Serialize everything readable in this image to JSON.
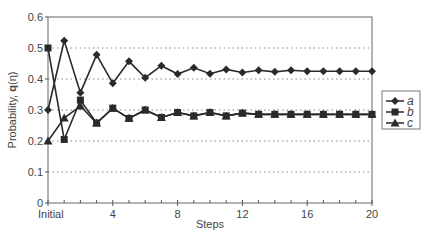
{
  "chart_data": {
    "type": "line",
    "title": "",
    "xlabel": "Steps",
    "ylabel": "Probability, q(η)",
    "ylabel_bold_part": "q",
    "ylabel_prefix": "Probability, ",
    "ylabel_suffix": "(η)",
    "x": [
      0,
      1,
      2,
      3,
      4,
      5,
      6,
      7,
      8,
      9,
      10,
      11,
      12,
      13,
      14,
      15,
      16,
      17,
      18,
      19,
      20
    ],
    "xlim": [
      0,
      20
    ],
    "ylim": [
      0,
      0.6
    ],
    "xticks": [
      {
        "value": 0,
        "label": "Initial"
      },
      {
        "value": 4,
        "label": "4"
      },
      {
        "value": 8,
        "label": "8"
      },
      {
        "value": 12,
        "label": "12"
      },
      {
        "value": 16,
        "label": "16"
      },
      {
        "value": 20,
        "label": "20"
      }
    ],
    "yticks": [
      {
        "value": 0,
        "label": "0"
      },
      {
        "value": 0.1,
        "label": "0.1"
      },
      {
        "value": 0.2,
        "label": "0.2"
      },
      {
        "value": 0.3,
        "label": "0.3"
      },
      {
        "value": 0.4,
        "label": "0.4"
      },
      {
        "value": 0.5,
        "label": "0.5"
      },
      {
        "value": 0.6,
        "label": "0.6"
      }
    ],
    "grid": {
      "y": true,
      "x": false,
      "style": "dotted"
    },
    "legend_position": "right",
    "series": [
      {
        "name": "a",
        "marker": "diamond",
        "values": [
          0.3,
          0.523,
          0.356,
          0.478,
          0.386,
          0.457,
          0.404,
          0.443,
          0.416,
          0.436,
          0.417,
          0.431,
          0.421,
          0.428,
          0.423,
          0.428,
          0.425,
          0.425,
          0.425,
          0.425,
          0.425
        ]
      },
      {
        "name": "b",
        "marker": "square",
        "values": [
          0.5,
          0.205,
          0.332,
          0.258,
          0.306,
          0.273,
          0.3,
          0.276,
          0.292,
          0.281,
          0.292,
          0.281,
          0.29,
          0.286,
          0.286,
          0.286,
          0.286,
          0.286,
          0.286,
          0.286,
          0.286
        ]
      },
      {
        "name": "c",
        "marker": "triangle",
        "values": [
          0.2,
          0.274,
          0.313,
          0.258,
          0.306,
          0.273,
          0.3,
          0.276,
          0.292,
          0.281,
          0.292,
          0.281,
          0.29,
          0.286,
          0.286,
          0.286,
          0.286,
          0.286,
          0.286,
          0.286,
          0.286
        ]
      }
    ]
  },
  "colors": {
    "line": "#2a2a2a",
    "axis": "#555555",
    "grid": "#888888",
    "text": "#444444"
  }
}
